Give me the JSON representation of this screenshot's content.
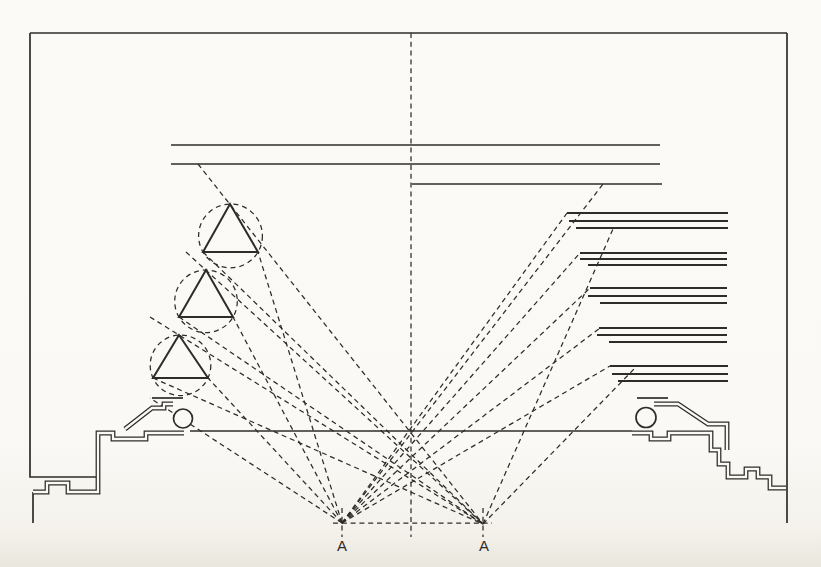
{
  "figure": {
    "canvas": {
      "width": 821,
      "height": 567,
      "background": "#faf9f6",
      "ink": "#2e2c28"
    },
    "solid_polylines": [
      {
        "name": "frame-top-edge",
        "pts": [
          [
            30,
            33
          ],
          [
            787,
            33
          ]
        ]
      },
      {
        "name": "frame-left-edge-ledge",
        "pts": [
          [
            30,
            33
          ],
          [
            30,
            477
          ],
          [
            98,
            477
          ]
        ]
      },
      {
        "name": "frame-right-edge",
        "pts": [
          [
            787,
            33
          ],
          [
            787,
            523
          ]
        ]
      },
      {
        "name": "ceiling-line",
        "pts": [
          [
            190,
            431
          ],
          [
            632,
            431
          ]
        ]
      },
      {
        "name": "upper-shelf-line-1",
        "pts": [
          [
            171,
            145
          ],
          [
            660,
            145
          ]
        ]
      },
      {
        "name": "upper-shelf-line-2",
        "pts": [
          [
            171,
            164
          ],
          [
            660,
            164
          ]
        ]
      },
      {
        "name": "upper-shelf-line-3",
        "pts": [
          [
            412,
            184
          ],
          [
            662,
            184
          ]
        ]
      },
      {
        "name": "left-cornice-cap-line",
        "pts": [
          [
            152,
            398
          ],
          [
            183,
            398
          ]
        ]
      },
      {
        "name": "right-cornice-cap-line",
        "pts": [
          [
            637,
            398
          ],
          [
            668,
            398
          ]
        ]
      },
      {
        "name": "left-wall-tail",
        "pts": [
          [
            33,
            492
          ],
          [
            33,
            523
          ]
        ]
      }
    ],
    "double_line_paths": [
      {
        "name": "left-wall-profile",
        "d": "M184,433 H146 V439 H113 V433 H98 V492 H68 V483 H47 V492 H33"
      },
      {
        "name": "left-cornice-profile",
        "d": "M125,429 L152,408 H164 V404 H173"
      },
      {
        "name": "right-wall-profile",
        "d": "M632,433 H651 V439 H669 V433 H711 V450 H719 V464 H728 V477 H746 V469 H758 V477 H770 V488 H786"
      },
      {
        "name": "right-cornice-profile",
        "d": "M654,404 H678 L708,424 H727 V450"
      }
    ],
    "volute_scrolls": [
      {
        "name": "left-volute-scroll",
        "cx": 183,
        "cy": 418.5,
        "r": 9.5
      },
      {
        "name": "right-volute-scroll",
        "cx": 646,
        "cy": 417.5,
        "r": 10
      }
    ],
    "triangles": [
      {
        "name": "reflector-prism-1",
        "pts": [
          [
            230,
            204
          ],
          [
            203,
            252
          ],
          [
            258,
            252
          ]
        ]
      },
      {
        "name": "reflector-prism-2",
        "pts": [
          [
            206,
            270
          ],
          [
            179,
            317
          ],
          [
            233,
            317
          ]
        ]
      },
      {
        "name": "reflector-prism-3",
        "pts": [
          [
            179,
            335
          ],
          [
            153,
            378
          ],
          [
            208,
            378
          ]
        ]
      }
    ],
    "dashed_circles": [
      {
        "name": "prism-circumcircle-1",
        "cx": 230.5,
        "cy": 235.9,
        "r": 31.9
      },
      {
        "name": "prism-circumcircle-2",
        "cx": 206.0,
        "cy": 301.3,
        "r": 31.3
      },
      {
        "name": "prism-circumcircle-3",
        "cx": 180.5,
        "cy": 365.3,
        "r": 30.3
      }
    ],
    "louver_groups": [
      {
        "name": "louver-group-1",
        "lines": [
          [
            567,
            213,
            728
          ],
          [
            569,
            221,
            728
          ],
          [
            576,
            228,
            728
          ]
        ]
      },
      {
        "name": "louver-group-2",
        "lines": [
          [
            580,
            253,
            727
          ],
          [
            580,
            259,
            727
          ],
          [
            588,
            265,
            727
          ]
        ]
      },
      {
        "name": "louver-group-3",
        "lines": [
          [
            590,
            288,
            727
          ],
          [
            588,
            296,
            727
          ],
          [
            600,
            303,
            727
          ]
        ]
      },
      {
        "name": "louver-group-4",
        "lines": [
          [
            599,
            328,
            727
          ],
          [
            597,
            335,
            727
          ],
          [
            609,
            342,
            727
          ]
        ]
      },
      {
        "name": "louver-group-5",
        "lines": [
          [
            610,
            366,
            728
          ],
          [
            612,
            374,
            728
          ],
          [
            618,
            381,
            728
          ]
        ]
      }
    ],
    "dashed_lines": [
      {
        "name": "center-axis",
        "pts": [
          [
            411,
            33
          ],
          [
            411,
            537
          ]
        ]
      },
      {
        "name": "baseline-a-a",
        "pts": [
          [
            333,
            523
          ],
          [
            492,
            523
          ]
        ]
      },
      {
        "name": "left-a-tick",
        "pts": [
          [
            342,
            508
          ],
          [
            342,
            537
          ]
        ]
      },
      {
        "name": "right-a-tick",
        "pts": [
          [
            483,
            508
          ],
          [
            483,
            537
          ]
        ]
      },
      {
        "name": "ray-leftA-shelf3-end",
        "pts": [
          [
            342,
            523
          ],
          [
            603,
            184
          ]
        ]
      },
      {
        "name": "ray-leftA-louver1",
        "pts": [
          [
            342,
            523
          ],
          [
            567,
            213
          ]
        ]
      },
      {
        "name": "ray-leftA-louver2",
        "pts": [
          [
            342,
            523
          ],
          [
            580,
            253
          ]
        ]
      },
      {
        "name": "ray-leftA-louver3",
        "pts": [
          [
            342,
            523
          ],
          [
            590,
            288
          ]
        ]
      },
      {
        "name": "ray-leftA-louver4",
        "pts": [
          [
            342,
            523
          ],
          [
            600,
            328
          ]
        ]
      },
      {
        "name": "ray-leftA-louver5",
        "pts": [
          [
            342,
            523
          ],
          [
            610,
            366
          ]
        ]
      },
      {
        "name": "ray-leftA-prism1",
        "pts": [
          [
            342,
            523
          ],
          [
            258,
            252
          ]
        ]
      },
      {
        "name": "ray-leftA-prism2",
        "pts": [
          [
            342,
            523
          ],
          [
            233,
            317
          ]
        ]
      },
      {
        "name": "ray-leftA-prism3",
        "pts": [
          [
            342,
            523
          ],
          [
            208,
            378
          ]
        ]
      },
      {
        "name": "ray-leftA-cornice",
        "pts": [
          [
            342,
            523
          ],
          [
            150,
            398
          ]
        ]
      },
      {
        "name": "ray-rightA-apex1",
        "pts": [
          [
            198,
            164
          ],
          [
            483,
            524
          ]
        ]
      },
      {
        "name": "ray-rightA-base1",
        "pts": [
          [
            203,
            252
          ],
          [
            483,
            524
          ]
        ]
      },
      {
        "name": "ray-rightA-apex2",
        "pts": [
          [
            186,
            252
          ],
          [
            483,
            524
          ]
        ]
      },
      {
        "name": "ray-rightA-base2",
        "pts": [
          [
            179,
            317
          ],
          [
            483,
            524
          ]
        ]
      },
      {
        "name": "ray-rightA-apex3",
        "pts": [
          [
            150,
            317
          ],
          [
            483,
            524
          ]
        ]
      },
      {
        "name": "ray-rightA-base3",
        "pts": [
          [
            153,
            378
          ],
          [
            483,
            524
          ]
        ]
      },
      {
        "name": "ray-rightA-louver1",
        "pts": [
          [
            483,
            524
          ],
          [
            613,
            229
          ]
        ]
      },
      {
        "name": "ray-rightA-louver5",
        "pts": [
          [
            483,
            524
          ],
          [
            635,
            368
          ]
        ]
      }
    ],
    "point_labels": [
      {
        "name": "label-a-left",
        "text": "A",
        "x": 342,
        "y": 551
      },
      {
        "name": "label-a-right",
        "text": "A",
        "x": 484,
        "y": 551
      }
    ]
  }
}
